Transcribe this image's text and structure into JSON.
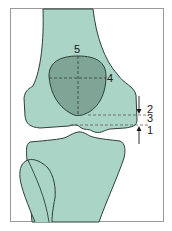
{
  "diagram": {
    "colors": {
      "bone_fill": "#a9d4c6",
      "lesion_fill": "#7fa596",
      "outline": "#2f3f38",
      "frame": "#9a9a9a",
      "dash": "#3a3a3a"
    },
    "labels": {
      "l1": "1",
      "l2": "2",
      "l3": "3",
      "l4": "4",
      "l5": "5"
    },
    "structures": [
      "femur",
      "tibia",
      "fibula",
      "lesion"
    ]
  }
}
